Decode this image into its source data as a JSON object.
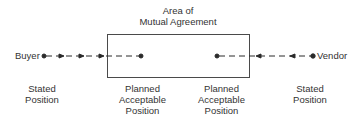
{
  "diagram": {
    "area_title_line1": "Area of",
    "area_title_line2": "Mutual Agreement",
    "left_party": "Buyer",
    "right_party": "Vendor",
    "labels": {
      "buyer_stated": [
        "Stated",
        "Position"
      ],
      "buyer_planned": [
        "Planned",
        "Acceptable",
        "Position"
      ],
      "vendor_planned": [
        "Planned",
        "Acceptable",
        "Position"
      ],
      "vendor_stated": [
        "Stated",
        "Position"
      ]
    },
    "colors": {
      "line": "#2a2a2a",
      "box": "#4a4a4a",
      "text": "#333333"
    }
  }
}
